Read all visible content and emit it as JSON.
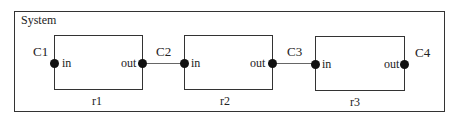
{
  "diagram": {
    "type": "block-diagram",
    "frame": {
      "title": "System"
    },
    "components": [
      {
        "id": "r1",
        "label": "r1",
        "ports": {
          "in": "in",
          "out": "out"
        }
      },
      {
        "id": "r2",
        "label": "r2",
        "ports": {
          "in": "in",
          "out": "out"
        }
      },
      {
        "id": "r3",
        "label": "r3",
        "ports": {
          "in": "in",
          "out": "out"
        }
      }
    ],
    "connectors": [
      {
        "label": "C1",
        "attached_to": "r1.in"
      },
      {
        "label": "C2",
        "from": "r1.out",
        "to": "r2.in"
      },
      {
        "label": "C3",
        "from": "r2.out",
        "to": "r3.in"
      },
      {
        "label": "C4",
        "attached_to": "r3.out"
      }
    ],
    "colors": {
      "line": "#333333",
      "port": "#111111",
      "wire": "#666666",
      "background": "#ffffff"
    }
  }
}
